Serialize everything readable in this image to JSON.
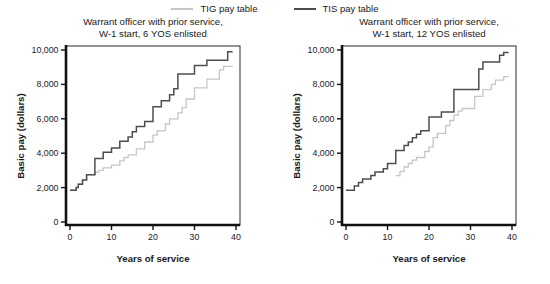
{
  "figure": {
    "background": "#ffffff"
  },
  "legend": {
    "items": [
      {
        "label": "TIG pay table",
        "color": "#c6c6c6"
      },
      {
        "label": "TIS pay table",
        "color": "#4d4d4d"
      }
    ]
  },
  "chart_data": [
    {
      "type": "line",
      "subtype": "step",
      "title_line1": "Warrant officer with prior service,",
      "title_line2": "W-1 start, 6 YOS enlisted",
      "xlabel": "Years of service",
      "ylabel": "Basic pay (dollars)",
      "xlim": [
        0,
        40
      ],
      "ylim": [
        0,
        10000
      ],
      "grid": false,
      "legend_position": "top-center",
      "xticks": [
        0,
        10,
        20,
        30,
        40
      ],
      "xtick_labels": [
        "0",
        "10",
        "20",
        "30",
        "40"
      ],
      "yticks": [
        0,
        2000,
        4000,
        6000,
        8000,
        10000
      ],
      "ytick_labels": [
        "0",
        "2,000",
        "4,000",
        "6,000",
        "8,000",
        "10,000"
      ],
      "series": [
        {
          "key": "tig",
          "name": "TIG pay table",
          "color": "#c6c6c6",
          "width": 1.3,
          "end_year": 39.2,
          "points": [
            [
              0,
              1850
            ],
            [
              1.5,
              2000
            ],
            [
              2,
              2200
            ],
            [
              3,
              2450
            ],
            [
              4,
              2750
            ],
            [
              6,
              2900
            ],
            [
              7,
              3000
            ],
            [
              8,
              3150
            ],
            [
              10,
              3300
            ],
            [
              12,
              3550
            ],
            [
              13,
              3750
            ],
            [
              14,
              3900
            ],
            [
              16,
              4250
            ],
            [
              18,
              4650
            ],
            [
              20,
              5050
            ],
            [
              21,
              5300
            ],
            [
              23,
              5700
            ],
            [
              24,
              6000
            ],
            [
              26,
              6350
            ],
            [
              27,
              6650
            ],
            [
              28,
              7150
            ],
            [
              30,
              7800
            ],
            [
              33,
              8300
            ],
            [
              36,
              8850
            ],
            [
              37,
              9050
            ]
          ]
        },
        {
          "key": "tis",
          "name": "TIS pay table",
          "color": "#4d4d4d",
          "width": 1.5,
          "end_year": 39.2,
          "points": [
            [
              0,
              1850
            ],
            [
              1.5,
              2000
            ],
            [
              2,
              2200
            ],
            [
              3,
              2450
            ],
            [
              4,
              2750
            ],
            [
              6,
              3700
            ],
            [
              8,
              4050
            ],
            [
              10,
              4300
            ],
            [
              12,
              4700
            ],
            [
              14,
              4950
            ],
            [
              15,
              5250
            ],
            [
              16,
              5550
            ],
            [
              18,
              5850
            ],
            [
              20,
              6700
            ],
            [
              22,
              7050
            ],
            [
              24,
              7400
            ],
            [
              25,
              7750
            ],
            [
              26,
              8600
            ],
            [
              30,
              9100
            ],
            [
              33,
              9400
            ],
            [
              38,
              9900
            ]
          ]
        }
      ]
    },
    {
      "type": "line",
      "subtype": "step",
      "title_line1": "Warrant officer with prior service,",
      "title_line2": "W-1 start, 12 YOS enlisted",
      "xlabel": "Years of service",
      "ylabel": "Basic pay (dollars)",
      "xlim": [
        0,
        40
      ],
      "ylim": [
        0,
        10000
      ],
      "grid": false,
      "legend_position": "top-center",
      "xticks": [
        0,
        10,
        20,
        30,
        40
      ],
      "xtick_labels": [
        "0",
        "10",
        "20",
        "30",
        "40"
      ],
      "yticks": [
        0,
        2000,
        4000,
        6000,
        8000,
        10000
      ],
      "ytick_labels": [
        "0",
        "2,000",
        "4,000",
        "6,000",
        "8,000",
        "10,000"
      ],
      "series": [
        {
          "key": "tig",
          "name": "TIG pay table",
          "color": "#c6c6c6",
          "width": 1.3,
          "end_year": 39.2,
          "points": [
            [
              12,
              2700
            ],
            [
              13,
              2950
            ],
            [
              14,
              3200
            ],
            [
              15,
              3400
            ],
            [
              16,
              3600
            ],
            [
              17,
              3750
            ],
            [
              19,
              4100
            ],
            [
              20,
              4350
            ],
            [
              21,
              4900
            ],
            [
              22,
              5150
            ],
            [
              24,
              5600
            ],
            [
              25,
              5900
            ],
            [
              26,
              6200
            ],
            [
              27,
              6450
            ],
            [
              28,
              6600
            ],
            [
              31,
              7300
            ],
            [
              33,
              7700
            ],
            [
              35,
              8000
            ],
            [
              36,
              8250
            ],
            [
              38,
              8450
            ]
          ]
        },
        {
          "key": "tis",
          "name": "TIS pay table",
          "color": "#4d4d4d",
          "width": 1.5,
          "end_year": 39.2,
          "points": [
            [
              0,
              1850
            ],
            [
              2,
              2100
            ],
            [
              3,
              2300
            ],
            [
              4,
              2500
            ],
            [
              6,
              2700
            ],
            [
              7,
              2900
            ],
            [
              9,
              3100
            ],
            [
              10,
              3400
            ],
            [
              12,
              4150
            ],
            [
              14,
              4450
            ],
            [
              15,
              4650
            ],
            [
              16,
              4900
            ],
            [
              17,
              5100
            ],
            [
              18,
              5300
            ],
            [
              20,
              6100
            ],
            [
              23,
              6400
            ],
            [
              26,
              7700
            ],
            [
              32,
              8900
            ],
            [
              33,
              9300
            ],
            [
              37,
              9700
            ],
            [
              38,
              9850
            ]
          ]
        }
      ]
    }
  ]
}
